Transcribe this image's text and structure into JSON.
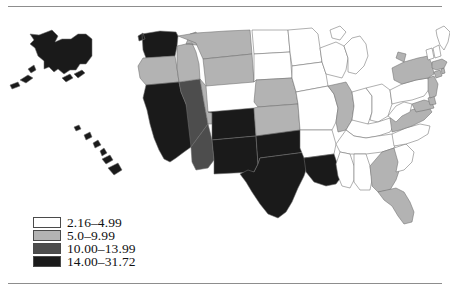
{
  "figure": {
    "type": "choropleth-map",
    "region": "United States",
    "frame_rules": 2
  },
  "legend": {
    "position": "bottom-left",
    "items": [
      {
        "label": "2.16–4.99",
        "color": "#ffffff",
        "class_index": 1,
        "min": 2.16,
        "max": 4.99
      },
      {
        "label": "5.0–9.99",
        "color": "#b3b3b3",
        "class_index": 2,
        "min": 5.0,
        "max": 9.99
      },
      {
        "label": "10.00–13.99",
        "color": "#4d4d4d",
        "class_index": 3,
        "min": 10.0,
        "max": 13.99
      },
      {
        "label": "14.00–31.72",
        "color": "#1a1a1a",
        "class_index": 4,
        "min": 14.0,
        "max": 31.72
      }
    ]
  },
  "chart_data": {
    "type": "choropleth",
    "title": "",
    "xlabel": "",
    "ylabel": "",
    "value_range": [
      2.16,
      31.72
    ],
    "class_colors": [
      "#ffffff",
      "#b3b3b3",
      "#4d4d4d",
      "#1a1a1a"
    ],
    "class_labels": [
      "2.16–4.99",
      "5.0–9.99",
      "10.00–13.99",
      "14.00–31.72"
    ],
    "states": [
      {
        "code": "AK",
        "name": "Alaska",
        "class_index": 4
      },
      {
        "code": "HI",
        "name": "Hawaii",
        "class_index": 4
      },
      {
        "code": "WA",
        "name": "Washington",
        "class_index": 4
      },
      {
        "code": "OR",
        "name": "Oregon",
        "class_index": 2
      },
      {
        "code": "CA",
        "name": "California",
        "class_index": 4
      },
      {
        "code": "NV",
        "name": "Nevada",
        "class_index": 3
      },
      {
        "code": "ID",
        "name": "Idaho",
        "class_index": 2
      },
      {
        "code": "MT",
        "name": "Montana",
        "class_index": 2
      },
      {
        "code": "WY",
        "name": "Wyoming",
        "class_index": 2
      },
      {
        "code": "UT",
        "name": "Utah",
        "class_index": 2
      },
      {
        "code": "AZ",
        "name": "Arizona",
        "class_index": 3
      },
      {
        "code": "CO",
        "name": "Colorado",
        "class_index": 4
      },
      {
        "code": "NM",
        "name": "New Mexico",
        "class_index": 4
      },
      {
        "code": "ND",
        "name": "North Dakota",
        "class_index": 1
      },
      {
        "code": "SD",
        "name": "South Dakota",
        "class_index": 1
      },
      {
        "code": "NE",
        "name": "Nebraska",
        "class_index": 2
      },
      {
        "code": "KS",
        "name": "Kansas",
        "class_index": 2
      },
      {
        "code": "OK",
        "name": "Oklahoma",
        "class_index": 4
      },
      {
        "code": "TX",
        "name": "Texas",
        "class_index": 4
      },
      {
        "code": "MN",
        "name": "Minnesota",
        "class_index": 1
      },
      {
        "code": "IA",
        "name": "Iowa",
        "class_index": 1
      },
      {
        "code": "MO",
        "name": "Missouri",
        "class_index": 1
      },
      {
        "code": "AR",
        "name": "Arkansas",
        "class_index": 1
      },
      {
        "code": "LA",
        "name": "Louisiana",
        "class_index": 4
      },
      {
        "code": "WI",
        "name": "Wisconsin",
        "class_index": 1
      },
      {
        "code": "IL",
        "name": "Illinois",
        "class_index": 2
      },
      {
        "code": "MI",
        "name": "Michigan",
        "class_index": 1
      },
      {
        "code": "IN",
        "name": "Indiana",
        "class_index": 1
      },
      {
        "code": "OH",
        "name": "Ohio",
        "class_index": 1
      },
      {
        "code": "KY",
        "name": "Kentucky",
        "class_index": 1
      },
      {
        "code": "TN",
        "name": "Tennessee",
        "class_index": 1
      },
      {
        "code": "MS",
        "name": "Mississippi",
        "class_index": 1
      },
      {
        "code": "AL",
        "name": "Alabama",
        "class_index": 1
      },
      {
        "code": "GA",
        "name": "Georgia",
        "class_index": 2
      },
      {
        "code": "FL",
        "name": "Florida",
        "class_index": 2
      },
      {
        "code": "SC",
        "name": "South Carolina",
        "class_index": 1
      },
      {
        "code": "NC",
        "name": "North Carolina",
        "class_index": 1
      },
      {
        "code": "VA",
        "name": "Virginia",
        "class_index": 2
      },
      {
        "code": "WV",
        "name": "West Virginia",
        "class_index": 1
      },
      {
        "code": "MD",
        "name": "Maryland",
        "class_index": 2
      },
      {
        "code": "DE",
        "name": "Delaware",
        "class_index": 2
      },
      {
        "code": "PA",
        "name": "Pennsylvania",
        "class_index": 1
      },
      {
        "code": "NJ",
        "name": "New Jersey",
        "class_index": 2
      },
      {
        "code": "NY",
        "name": "New York",
        "class_index": 2
      },
      {
        "code": "CT",
        "name": "Connecticut",
        "class_index": 2
      },
      {
        "code": "RI",
        "name": "Rhode Island",
        "class_index": 2
      },
      {
        "code": "MA",
        "name": "Massachusetts",
        "class_index": 2
      },
      {
        "code": "VT",
        "name": "Vermont",
        "class_index": 1
      },
      {
        "code": "NH",
        "name": "New Hampshire",
        "class_index": 1
      },
      {
        "code": "ME",
        "name": "Maine",
        "class_index": 1
      }
    ]
  }
}
